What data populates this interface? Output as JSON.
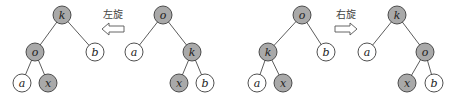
{
  "diagram": {
    "type": "binary-tree-rotation",
    "node_radius": 9,
    "colors": {
      "shaded": "#a9a9a9",
      "plain": "#ffffff",
      "stroke": "#3c3c3c"
    },
    "trees": [
      {
        "id": "tree1",
        "nodes": [
          {
            "id": "k",
            "label": "k",
            "x": 62,
            "y": 15,
            "shaded": true
          },
          {
            "id": "o",
            "label": "o",
            "x": 35,
            "y": 52,
            "shaded": true
          },
          {
            "id": "b",
            "label": "b",
            "x": 95,
            "y": 52,
            "shaded": false
          },
          {
            "id": "a",
            "label": "a",
            "x": 22,
            "y": 83,
            "shaded": false
          },
          {
            "id": "x",
            "label": "x",
            "x": 48,
            "y": 83,
            "shaded": true
          }
        ],
        "edges": [
          [
            "k",
            "o"
          ],
          [
            "k",
            "b"
          ],
          [
            "o",
            "a"
          ],
          [
            "o",
            "x"
          ]
        ]
      },
      {
        "id": "tree2",
        "nodes": [
          {
            "id": "o",
            "label": "o",
            "x": 163,
            "y": 15,
            "shaded": true
          },
          {
            "id": "a",
            "label": "a",
            "x": 134,
            "y": 52,
            "shaded": false
          },
          {
            "id": "k",
            "label": "k",
            "x": 192,
            "y": 52,
            "shaded": true
          },
          {
            "id": "x",
            "label": "x",
            "x": 179,
            "y": 83,
            "shaded": true
          },
          {
            "id": "b",
            "label": "b",
            "x": 205,
            "y": 83,
            "shaded": false
          }
        ],
        "edges": [
          [
            "o",
            "a"
          ],
          [
            "o",
            "k"
          ],
          [
            "k",
            "x"
          ],
          [
            "k",
            "b"
          ]
        ]
      },
      {
        "id": "tree3",
        "nodes": [
          {
            "id": "o",
            "label": "o",
            "x": 302,
            "y": 15,
            "shaded": true
          },
          {
            "id": "k",
            "label": "k",
            "x": 268,
            "y": 52,
            "shaded": true
          },
          {
            "id": "b",
            "label": "b",
            "x": 326,
            "y": 52,
            "shaded": false
          },
          {
            "id": "a",
            "label": "a",
            "x": 257,
            "y": 83,
            "shaded": false
          },
          {
            "id": "x",
            "label": "x",
            "x": 283,
            "y": 83,
            "shaded": true
          }
        ],
        "edges": [
          [
            "o",
            "k"
          ],
          [
            "o",
            "b"
          ],
          [
            "k",
            "a"
          ],
          [
            "k",
            "x"
          ]
        ]
      },
      {
        "id": "tree4",
        "nodes": [
          {
            "id": "k",
            "label": "k",
            "x": 397,
            "y": 15,
            "shaded": true
          },
          {
            "id": "a",
            "label": "a",
            "x": 367,
            "y": 52,
            "shaded": false
          },
          {
            "id": "o",
            "label": "o",
            "x": 425,
            "y": 52,
            "shaded": true
          },
          {
            "id": "x",
            "label": "x",
            "x": 407,
            "y": 83,
            "shaded": true
          },
          {
            "id": "b",
            "label": "b",
            "x": 434,
            "y": 83,
            "shaded": false
          }
        ],
        "edges": [
          [
            "k",
            "a"
          ],
          [
            "k",
            "o"
          ],
          [
            "o",
            "x"
          ],
          [
            "o",
            "b"
          ]
        ]
      }
    ],
    "arrows": [
      {
        "id": "rotate-left",
        "label": "左旋",
        "direction": "left",
        "x": 113,
        "label_y": 18,
        "arrow_y": 29
      },
      {
        "id": "rotate-right",
        "label": "右旋",
        "direction": "right",
        "x": 346,
        "label_y": 18,
        "arrow_y": 29
      }
    ]
  }
}
